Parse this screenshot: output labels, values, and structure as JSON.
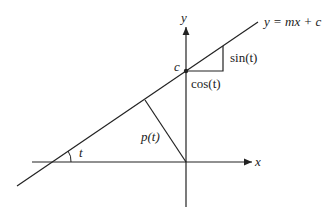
{
  "diagram": {
    "line_label": "y = mx + c",
    "x_axis_label": "x",
    "y_axis_label": "y",
    "intercept_label": "c",
    "rise_label": "sin(t)",
    "run_label": "cos(t)",
    "perpendicular_label": "p(t)",
    "angle_label": "t",
    "colors": {
      "stroke": "#222222",
      "background": "#ffffff"
    }
  }
}
